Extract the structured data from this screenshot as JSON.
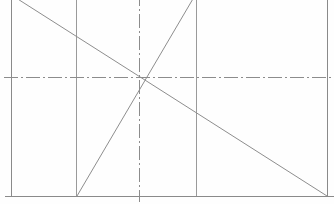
{
  "document": {
    "title": "Technical Line Drawing",
    "type": "engineering-sketch",
    "width": 334,
    "height": 204,
    "background_color": "#fefefe"
  },
  "style": {
    "border_color": "#8a8a8a",
    "grid_color": "#9a9a9a",
    "centerline_color": "#8c8c8c",
    "diagonal_color": "#8d8d8d",
    "border_width": 1,
    "grid_width": 1,
    "centerline_width": 1,
    "diagonal_width": 1,
    "centerline_dash": "14 3 2 3"
  },
  "geometry": {
    "frame": {
      "label": "outer-rectangle",
      "left": 11,
      "top": -8,
      "right": 327,
      "bottom": 196
    },
    "vertical_grid_lines": [
      {
        "label": "vertical-grid-left",
        "x": 76,
        "y1": -8,
        "y2": 196
      },
      {
        "label": "vertical-grid-right",
        "x": 196,
        "y1": -8,
        "y2": 196
      }
    ],
    "centerlines": [
      {
        "label": "horizontal-centerline",
        "x1": 4,
        "y1": 77,
        "x2": 334,
        "y2": 77
      },
      {
        "label": "vertical-centerline",
        "x1": 139,
        "y1": -8,
        "x2": 139,
        "y2": 202
      }
    ],
    "diagonals": [
      {
        "label": "descending-diagonal",
        "x1": 13,
        "y1": -4,
        "x2": 327,
        "y2": 196
      },
      {
        "label": "ascending-diagonal",
        "x1": 77,
        "y1": 196,
        "x2": 197,
        "y2": -8
      }
    ],
    "intersection_point": {
      "label": "diagonal-crossing",
      "x": 141,
      "y": 79
    }
  }
}
